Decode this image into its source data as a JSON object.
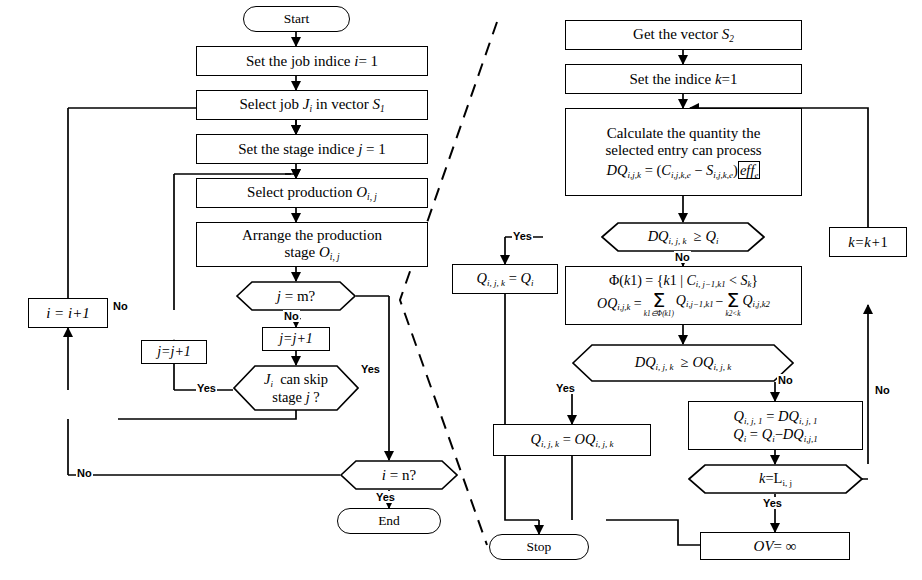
{
  "diagram": {
    "stroke_color": "#000000",
    "background": "#ffffff",
    "divider": "dashed-diagonal"
  },
  "left_panel": {
    "nodes": {
      "start": "Start",
      "set_job_indice": "Set the job indice <i class=\"v\">i</i>= 1",
      "select_job": "Select job <i class=\"v\">J</i><sub>i</sub> in vector <i class=\"v\">S</i><sub>1</sub>",
      "set_stage_indice": "Set the stage indice <i class=\"v\">j</i> = 1",
      "select_production": "Select production <i class=\"v\">O</i><sub>i, j</sub>",
      "arrange_production": "Arrange the production<br>stage <i class=\"v\">O</i><sub>i, j</sub>",
      "dec_j_eq_m": "<i class=\"v\">j</i> = m?",
      "inc_j_outer": "<i class=\"f\">j=j+1</i>",
      "inc_j_inner": "<i class=\"f\">j=j+1</i>",
      "dec_skip": "<i class=\"v\">J</i><sub>i</sub>&nbsp; can skip<br>stage <i class=\"v\">j</i> ?",
      "inc_i": "<i class=\"f\">i = i+1</i>",
      "dec_i_eq_n": "<i class=\"v\">i</i> = n?",
      "end": "End"
    },
    "edge_labels": {
      "j_eq_m_no": "No",
      "j_eq_m_yes": "Yes",
      "skip_yes": "Yes",
      "i_eq_n_no": "No",
      "i_eq_n_yes": "Yes",
      "inc_i_no": "No"
    }
  },
  "right_panel": {
    "nodes": {
      "get_vector": "Get the vector <i class=\"v\">S</i><sub>2</sub>",
      "set_indice_k": "Set the indice <i class=\"v\">k</i>=1",
      "calculate": "Calculate the quantity the<br>selected entry can process",
      "calculate_formula": "<i class=\"v\">DQ</i><sub>i,j,k</sub> = (<i class=\"v\">C</i><sub>i,j,k,e</sub> &minus; <i class=\"v\">S</i><sub>i,j,k,e</sub>)<span style=\"border:1.2px solid #000;padding:0 1px;\"><i class=\"f\">eff</i><sub>e</sub></span>",
      "dec_dq_ge_q": "<i class=\"v\">DQ</i><sub>i, j, k</sub> &nbsp;&ge; <i class=\"v\">Q</i><sub>i</sub>",
      "assign_q": "<i class=\"v\">Q</i><sub>i, j, k</sub> = <i class=\"v\">Q</i><sub>i</sub>",
      "phi_line1": "&Phi;(<i class=\"v\">k</i>1) = {<i class=\"v\">k</i>1 | <i class=\"v\">C</i><sub>i, j&minus;1,k1</sub> &lt; <i class=\"v\">S</i><sub>k</sub>}",
      "phi_line2_lhs": "<i class=\"v\">OQ</i><sub>i,j,k</sub> =",
      "phi_sum1_limit": "k1&isin;&Phi;(k1)",
      "phi_sum1_term": "<i class=\"v\">Q</i><sub>i,j&minus;1,k1</sub>",
      "phi_sum2_limit": "k2&lt;k",
      "phi_sum2_term": "<i class=\"v\">Q</i><sub>i,j,k2</sub>",
      "dec_dq_ge_oq": "<i class=\"v\">DQ</i><sub>i, j, k</sub> &nbsp;&ge; <i class=\"v\">OQ</i><sub>i, j, k</sub>",
      "assign_oq": "<i class=\"v\">Q</i><sub>i, j, k</sub> = <i class=\"v\">OQ</i><sub>i, j, k</sub>",
      "assign_dq_line1": "<i class=\"v\">Q</i><sub>i, j, 1</sub> = <i class=\"v\">DQ</i><sub>i, j, 1</sub>",
      "assign_dq_line2": "<i class=\"v\">Q</i><sub>i</sub> = <i class=\"v\">Q</i><sub>i</sub>&minus;<i class=\"v\">DQ</i><sub>i,j,1</sub>",
      "dec_k_eq_L": "<i class=\"v\">k</i>=L<sub style=\"font-style:normal\">i, j</sub>",
      "inc_k": "<i class=\"v\">k=k+</i>1",
      "ov_inf": "<i class=\"v\">OV</i>= &infin;",
      "stop": "Stop"
    },
    "edge_labels": {
      "dq_ge_q_yes": "Yes",
      "dq_ge_q_no": "No",
      "dq_ge_oq_yes": "Yes",
      "dq_ge_oq_no": "No",
      "k_eq_L_yes": "Yes",
      "k_eq_L_no": "No"
    }
  }
}
